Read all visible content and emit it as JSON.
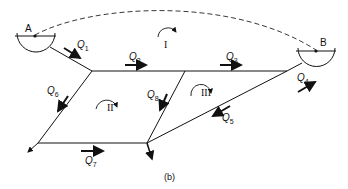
{
  "figure": {
    "caption": "(b)",
    "reservoirs": [
      {
        "id": "A",
        "label": "A"
      },
      {
        "id": "B",
        "label": "B"
      }
    ],
    "flows": [
      {
        "id": "Q1",
        "label": "Q",
        "sub": "1"
      },
      {
        "id": "Q2",
        "label": "Q",
        "sub": "2"
      },
      {
        "id": "Q3",
        "label": "Q",
        "sub": "3"
      },
      {
        "id": "Q4",
        "label": "Q",
        "sub": "4"
      },
      {
        "id": "Q5",
        "label": "Q",
        "sub": "5"
      },
      {
        "id": "Q6",
        "label": "Q",
        "sub": "6"
      },
      {
        "id": "Q7",
        "label": "Q",
        "sub": "7"
      },
      {
        "id": "Q8",
        "label": "Q",
        "sub": "8"
      }
    ],
    "loops": [
      {
        "id": "I",
        "label": "I"
      },
      {
        "id": "II",
        "label": "II"
      },
      {
        "id": "III",
        "label": "III"
      }
    ],
    "colors": {
      "line": "#111111",
      "background": "#ffffff"
    }
  }
}
